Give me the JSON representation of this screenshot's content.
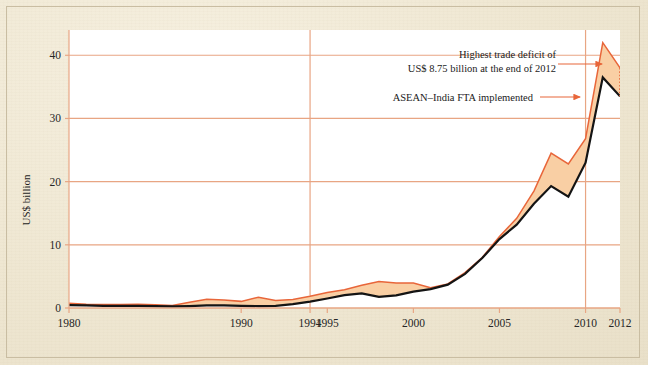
{
  "figure": {
    "background_color": "#efe7d2",
    "plot_background_color": "#ffffff",
    "border_color": "#c9bda2"
  },
  "chart_data": {
    "type": "area",
    "title": "",
    "xlabel": "",
    "ylabel": "US$ billion",
    "xlim": [
      1980,
      2012
    ],
    "ylim": [
      0,
      44
    ],
    "yticks": [
      0,
      10,
      20,
      30,
      40
    ],
    "xticks": [
      1980,
      1990,
      1994,
      1995,
      2000,
      2005,
      2010,
      2012
    ],
    "xtick_labels": [
      "1980",
      "1990",
      "1994",
      "1995",
      "2000",
      "2005",
      "2010",
      "2012"
    ],
    "ytick_labels": [
      "0",
      "10",
      "20",
      "30",
      "40"
    ],
    "grid": "horizontal",
    "legend": "none",
    "gridline_color": "#e8a583",
    "reference_lines_x": [
      1994,
      2010
    ],
    "fill_color": "#f9cfa4",
    "x": [
      1980,
      1981,
      1982,
      1983,
      1984,
      1985,
      1986,
      1987,
      1988,
      1989,
      1990,
      1991,
      1992,
      1993,
      1994,
      1995,
      1996,
      1997,
      1998,
      1999,
      2000,
      2001,
      2002,
      2003,
      2004,
      2005,
      2006,
      2007,
      2008,
      2009,
      2010,
      2011,
      2012
    ],
    "series": [
      {
        "name": "upper-line",
        "color": "#e8663a",
        "values": [
          0.75,
          0.6,
          0.55,
          0.55,
          0.6,
          0.5,
          0.4,
          0.9,
          1.4,
          1.25,
          1.05,
          1.7,
          1.2,
          1.35,
          1.85,
          2.45,
          2.9,
          3.6,
          4.2,
          3.95,
          3.95,
          3.2,
          3.8,
          5.6,
          8.0,
          11.3,
          14.2,
          18.5,
          24.5,
          22.8,
          26.8,
          42.0,
          38.0
        ]
      },
      {
        "name": "lower-line",
        "color": "#141414",
        "values": [
          0.45,
          0.4,
          0.35,
          0.35,
          0.35,
          0.3,
          0.25,
          0.3,
          0.4,
          0.4,
          0.35,
          0.3,
          0.35,
          0.6,
          1.0,
          1.5,
          2.05,
          2.3,
          1.75,
          2.0,
          2.6,
          3.0,
          3.7,
          5.4,
          7.9,
          10.9,
          13.2,
          16.5,
          19.3,
          17.6,
          23.0,
          36.5,
          33.5
        ]
      }
    ],
    "annotations": [
      {
        "name": "highest-trade-deficit",
        "line1": "Highest trade deficit of",
        "line2": "US$ 8.75 billion at the end of 2012",
        "arrow": true,
        "arrow_color": "#e8663a"
      },
      {
        "name": "fta-implemented",
        "line1": "ASEAN–India FTA implemented",
        "arrow": true,
        "arrow_color": "#e8663a"
      }
    ],
    "marker_dotted_line": {
      "name": "deficit-gap-marker",
      "x": 2012,
      "color": "#e8663a",
      "style": "dotted"
    }
  }
}
